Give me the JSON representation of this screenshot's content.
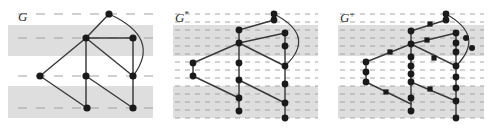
{
  "figure": {
    "width": 496,
    "height": 129,
    "background": "#ffffff",
    "band_color": "#dcdcdc",
    "band_color_dense": "#d6d6d6",
    "dash_color": "#9a9a9a",
    "edge_color": "#3a3a3a",
    "vertex_color": "#1a1a1a",
    "label_color": "#2b2b2b"
  },
  "panels": [
    {
      "id": "panel-g",
      "label": "G",
      "label_sup": "",
      "x": 0,
      "width": 165,
      "label_x": 18,
      "label_y": 10,
      "dash_mode": "sparse",
      "dash_rows": [
        14,
        38,
        76,
        108
      ],
      "bands": [
        {
          "y": 25,
          "height": 31
        },
        {
          "y": 86,
          "height": 32
        }
      ],
      "vertices": [
        {
          "name": "top",
          "x": 109,
          "y": 14,
          "shape": "circle",
          "r": 3.6
        },
        {
          "name": "hub",
          "x": 86,
          "y": 38,
          "shape": "circle",
          "r": 3.6
        },
        {
          "name": "right-upper",
          "x": 133,
          "y": 38,
          "shape": "circle",
          "r": 3.6
        },
        {
          "name": "left",
          "x": 40,
          "y": 76,
          "shape": "circle",
          "r": 3.6
        },
        {
          "name": "mid",
          "x": 86,
          "y": 76,
          "shape": "circle",
          "r": 3.6
        },
        {
          "name": "right-mid",
          "x": 133,
          "y": 76,
          "shape": "circle",
          "r": 3.6
        },
        {
          "name": "bottom-mid",
          "x": 87,
          "y": 108,
          "shape": "circle",
          "r": 3.6
        },
        {
          "name": "bottom-right",
          "x": 133,
          "y": 108,
          "shape": "circle",
          "r": 3.6
        }
      ],
      "edges": [
        {
          "from": [
            109,
            14
          ],
          "to": [
            86,
            38
          ],
          "type": "line"
        },
        {
          "from": [
            86,
            38
          ],
          "to": [
            133,
            38
          ],
          "type": "line"
        },
        {
          "from": [
            86,
            38
          ],
          "to": [
            40,
            76
          ],
          "type": "line"
        },
        {
          "from": [
            86,
            38
          ],
          "to": [
            86,
            76
          ],
          "type": "line"
        },
        {
          "from": [
            86,
            38
          ],
          "to": [
            133,
            76
          ],
          "type": "line"
        },
        {
          "from": [
            133,
            38
          ],
          "to": [
            133,
            76
          ],
          "type": "line"
        },
        {
          "from": [
            40,
            76
          ],
          "to": [
            87,
            108
          ],
          "type": "line"
        },
        {
          "from": [
            86,
            76
          ],
          "to": [
            86,
            108
          ],
          "type": "line"
        },
        {
          "from": [
            86,
            76
          ],
          "to": [
            133,
            108
          ],
          "type": "line"
        },
        {
          "from": [
            133,
            76
          ],
          "to": [
            133,
            108
          ],
          "type": "line"
        },
        {
          "from": [
            109,
            14
          ],
          "to": [
            133,
            76
          ],
          "type": "arc",
          "control": [
            162,
            38
          ]
        }
      ]
    },
    {
      "id": "panel-g-star",
      "label": "G",
      "label_sup": "*",
      "x": 165,
      "width": 165,
      "label_x": 10,
      "label_y": 10,
      "dash_mode": "dense",
      "dash_rows": [
        14,
        22,
        30,
        38,
        46,
        54,
        62,
        70,
        78,
        86,
        94,
        102,
        110,
        118
      ],
      "bands": [
        {
          "y": 25,
          "height": 31
        },
        {
          "y": 86,
          "height": 32
        }
      ],
      "vertices": [
        {
          "name": "top",
          "x": 109,
          "y": 14,
          "shape": "circle",
          "r": 3.4
        },
        {
          "name": "top-sub-1",
          "x": 109,
          "y": 20,
          "shape": "circle",
          "r": 3.4
        },
        {
          "name": "hub-upper",
          "x": 74,
          "y": 30,
          "shape": "circle",
          "r": 3.4
        },
        {
          "name": "hub",
          "x": 74,
          "y": 43,
          "shape": "circle",
          "r": 3.4
        },
        {
          "name": "right-upper",
          "x": 120,
          "y": 33,
          "shape": "circle",
          "r": 3.4
        },
        {
          "name": "right-upper-sub",
          "x": 120,
          "y": 46,
          "shape": "circle",
          "r": 3.4
        },
        {
          "name": "left-upper",
          "x": 28,
          "y": 63,
          "shape": "circle",
          "r": 3.4
        },
        {
          "name": "left",
          "x": 28,
          "y": 76,
          "shape": "circle",
          "r": 3.4
        },
        {
          "name": "mid-upper",
          "x": 74,
          "y": 63,
          "shape": "circle",
          "r": 3.4
        },
        {
          "name": "mid",
          "x": 74,
          "y": 80,
          "shape": "circle",
          "r": 3.4
        },
        {
          "name": "right-mid",
          "x": 120,
          "y": 66,
          "shape": "circle",
          "r": 3.4
        },
        {
          "name": "right-mid-sub",
          "x": 120,
          "y": 84,
          "shape": "circle",
          "r": 3.4
        },
        {
          "name": "mid-lower",
          "x": 74,
          "y": 98,
          "shape": "circle",
          "r": 3.4
        },
        {
          "name": "bottom-mid",
          "x": 74,
          "y": 111,
          "shape": "circle",
          "r": 3.4
        },
        {
          "name": "right-lower",
          "x": 120,
          "y": 103,
          "shape": "circle",
          "r": 3.4
        },
        {
          "name": "bottom-right",
          "x": 120,
          "y": 118,
          "shape": "circle",
          "r": 3.4
        }
      ],
      "edges": [
        {
          "from": [
            109,
            14
          ],
          "to": [
            109,
            20
          ],
          "type": "line"
        },
        {
          "from": [
            109,
            20
          ],
          "to": [
            74,
            30
          ],
          "type": "line"
        },
        {
          "from": [
            74,
            30
          ],
          "to": [
            74,
            43
          ],
          "type": "line"
        },
        {
          "from": [
            74,
            43
          ],
          "to": [
            120,
            33
          ],
          "type": "line"
        },
        {
          "from": [
            120,
            33
          ],
          "to": [
            120,
            46
          ],
          "type": "line"
        },
        {
          "from": [
            120,
            46
          ],
          "to": [
            120,
            66
          ],
          "type": "line"
        },
        {
          "from": [
            74,
            43
          ],
          "to": [
            28,
            63
          ],
          "type": "line"
        },
        {
          "from": [
            28,
            63
          ],
          "to": [
            28,
            76
          ],
          "type": "line"
        },
        {
          "from": [
            74,
            43
          ],
          "to": [
            74,
            63
          ],
          "type": "line"
        },
        {
          "from": [
            74,
            63
          ],
          "to": [
            74,
            80
          ],
          "type": "line"
        },
        {
          "from": [
            74,
            43
          ],
          "to": [
            120,
            66
          ],
          "type": "line"
        },
        {
          "from": [
            120,
            66
          ],
          "to": [
            120,
            84
          ],
          "type": "line"
        },
        {
          "from": [
            28,
            76
          ],
          "to": [
            74,
            98
          ],
          "type": "line"
        },
        {
          "from": [
            74,
            80
          ],
          "to": [
            74,
            98
          ],
          "type": "line"
        },
        {
          "from": [
            74,
            98
          ],
          "to": [
            74,
            111
          ],
          "type": "line"
        },
        {
          "from": [
            74,
            80
          ],
          "to": [
            120,
            103
          ],
          "type": "line"
        },
        {
          "from": [
            120,
            84
          ],
          "to": [
            120,
            103
          ],
          "type": "line"
        },
        {
          "from": [
            120,
            103
          ],
          "to": [
            120,
            118
          ],
          "type": "line"
        },
        {
          "from": [
            109,
            14
          ],
          "to": [
            120,
            66
          ],
          "type": "arc",
          "control": [
            152,
            36
          ]
        }
      ]
    },
    {
      "id": "panel-g-plus",
      "label": "G",
      "label_sup": "+",
      "x": 330,
      "width": 166,
      "label_x": 10,
      "label_y": 10,
      "dash_mode": "dense",
      "dash_rows": [
        14,
        22,
        30,
        38,
        46,
        54,
        62,
        70,
        78,
        86,
        94,
        102,
        110,
        118
      ],
      "bands": [
        {
          "y": 25,
          "height": 31
        },
        {
          "y": 86,
          "height": 32
        }
      ],
      "vertices": [
        {
          "name": "top",
          "x": 116,
          "y": 14,
          "shape": "circle",
          "r": 3.4
        },
        {
          "name": "top-sub-1",
          "x": 116,
          "y": 20,
          "shape": "circle",
          "r": 3.4
        },
        {
          "name": "top-diag-sub",
          "x": 100,
          "y": 24,
          "shape": "square",
          "r": 2.6
        },
        {
          "name": "hub-upper",
          "x": 81,
          "y": 31,
          "shape": "circle",
          "r": 3.4
        },
        {
          "name": "hub",
          "x": 81,
          "y": 44,
          "shape": "circle",
          "r": 3.4
        },
        {
          "name": "hub-sub-1",
          "x": 81,
          "y": 57,
          "shape": "circle",
          "r": 3.4
        },
        {
          "name": "hub-sub-2",
          "x": 81,
          "y": 66,
          "shape": "circle",
          "r": 3.4
        },
        {
          "name": "hub-sub-3",
          "x": 81,
          "y": 74,
          "shape": "circle",
          "r": 3.4
        },
        {
          "name": "hub-sub-4",
          "x": 81,
          "y": 82,
          "shape": "circle",
          "r": 3.4
        },
        {
          "name": "mid-lower",
          "x": 81,
          "y": 98,
          "shape": "circle",
          "r": 3.4
        },
        {
          "name": "bottom-mid",
          "x": 81,
          "y": 111,
          "shape": "circle",
          "r": 3.4
        },
        {
          "name": "hub-right-sub",
          "x": 97,
          "y": 40,
          "shape": "square",
          "r": 2.6
        },
        {
          "name": "right-upper",
          "x": 126,
          "y": 33,
          "shape": "circle",
          "r": 3.4
        },
        {
          "name": "right-upper-a",
          "x": 126,
          "y": 43,
          "shape": "circle",
          "r": 3.4
        },
        {
          "name": "right-upper-b",
          "x": 126,
          "y": 52,
          "shape": "circle",
          "r": 3.4
        },
        {
          "name": "right-mid",
          "x": 126,
          "y": 66,
          "shape": "circle",
          "r": 3.4
        },
        {
          "name": "right-mid-a",
          "x": 126,
          "y": 77,
          "shape": "circle",
          "r": 3.4
        },
        {
          "name": "right-mid-b",
          "x": 126,
          "y": 88,
          "shape": "circle",
          "r": 3.4
        },
        {
          "name": "right-lower",
          "x": 126,
          "y": 101,
          "shape": "circle",
          "r": 3.4
        },
        {
          "name": "bottom-right",
          "x": 126,
          "y": 118,
          "shape": "circle",
          "r": 3.4
        },
        {
          "name": "hub-left-sub",
          "x": 60,
          "y": 52,
          "shape": "square",
          "r": 2.6
        },
        {
          "name": "left-upper",
          "x": 36,
          "y": 62,
          "shape": "circle",
          "r": 3.4
        },
        {
          "name": "left",
          "x": 36,
          "y": 72,
          "shape": "circle",
          "r": 3.4
        },
        {
          "name": "left-lower",
          "x": 36,
          "y": 82,
          "shape": "circle",
          "r": 3.4
        },
        {
          "name": "left-diag-sub",
          "x": 56,
          "y": 92,
          "shape": "square",
          "r": 2.6
        },
        {
          "name": "hub-diag-sub",
          "x": 100,
          "y": 89,
          "shape": "square",
          "r": 2.6
        },
        {
          "name": "arc-sub-1",
          "x": 136,
          "y": 38,
          "shape": "circle",
          "r": 3.0
        },
        {
          "name": "arc-sub-2",
          "x": 142,
          "y": 48,
          "shape": "circle",
          "r": 3.0
        },
        {
          "name": "mid-diag-sub",
          "x": 104,
          "y": 58,
          "shape": "square",
          "r": 2.6
        }
      ],
      "edges": [
        {
          "from": [
            116,
            14
          ],
          "to": [
            116,
            20
          ],
          "type": "line"
        },
        {
          "from": [
            116,
            20
          ],
          "to": [
            81,
            31
          ],
          "type": "line"
        },
        {
          "from": [
            81,
            31
          ],
          "to": [
            81,
            44
          ],
          "type": "line"
        },
        {
          "from": [
            81,
            44
          ],
          "to": [
            126,
            33
          ],
          "type": "line"
        },
        {
          "from": [
            126,
            33
          ],
          "to": [
            126,
            52
          ],
          "type": "line"
        },
        {
          "from": [
            126,
            52
          ],
          "to": [
            126,
            66
          ],
          "type": "line"
        },
        {
          "from": [
            81,
            44
          ],
          "to": [
            36,
            62
          ],
          "type": "line"
        },
        {
          "from": [
            36,
            62
          ],
          "to": [
            36,
            82
          ],
          "type": "line"
        },
        {
          "from": [
            81,
            44
          ],
          "to": [
            81,
            82
          ],
          "type": "line"
        },
        {
          "from": [
            81,
            82
          ],
          "to": [
            81,
            111
          ],
          "type": "line"
        },
        {
          "from": [
            81,
            44
          ],
          "to": [
            126,
            66
          ],
          "type": "line"
        },
        {
          "from": [
            126,
            66
          ],
          "to": [
            126,
            88
          ],
          "type": "line"
        },
        {
          "from": [
            36,
            82
          ],
          "to": [
            81,
            104
          ],
          "type": "line"
        },
        {
          "from": [
            81,
            82
          ],
          "to": [
            126,
            101
          ],
          "type": "line"
        },
        {
          "from": [
            126,
            88
          ],
          "to": [
            126,
            118
          ],
          "type": "line"
        },
        {
          "from": [
            116,
            14
          ],
          "to": [
            126,
            66
          ],
          "type": "arc",
          "control": [
            156,
            36
          ]
        }
      ]
    }
  ]
}
